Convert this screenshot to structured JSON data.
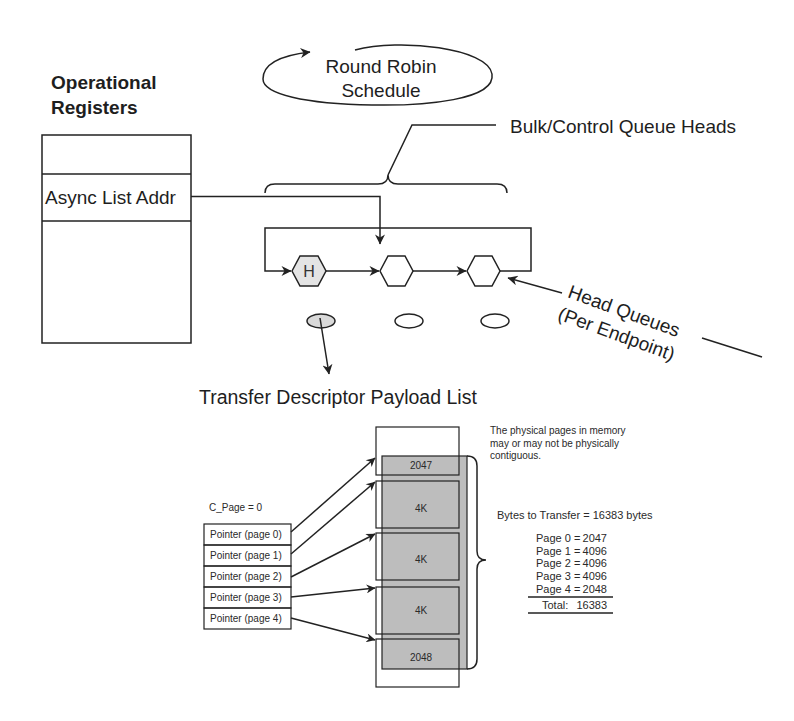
{
  "title_block": {
    "line1": "Operational",
    "line2": "Registers"
  },
  "registers": {
    "rows": [
      "",
      "Async List Addr",
      ""
    ]
  },
  "round_robin": {
    "line1": "Round Robin",
    "line2": "Schedule"
  },
  "bulk_label": "Bulk/Control Queue Heads",
  "queue_heads": [
    {
      "label": "H"
    },
    {
      "label": ""
    },
    {
      "label": ""
    }
  ],
  "head_queues_label": {
    "line1": "Head Queues",
    "line2": "(Per Endpoint)"
  },
  "payload_title": "Transfer Descriptor Payload List",
  "note": {
    "lines": [
      "The physical pages in memory",
      "may or may not be physically",
      "contiguous."
    ]
  },
  "c_page": "C_Page = 0",
  "pointers": [
    "Pointer (page 0)",
    "Pointer (page 1)",
    "Pointer (page 2)",
    "Pointer (page 3)",
    "Pointer (page 4)"
  ],
  "pages": [
    "2047",
    "4K",
    "4K",
    "4K",
    "2048"
  ],
  "bytes_summary": {
    "header": "Bytes to Transfer = 16383 bytes",
    "rows": [
      {
        "label": "Page 0 =",
        "value": "2047"
      },
      {
        "label": "Page 1 =",
        "value": "4096"
      },
      {
        "label": "Page 2 =",
        "value": "4096"
      },
      {
        "label": "Page 3 =",
        "value": "4096"
      },
      {
        "label": "Page 4 =",
        "value": "2048"
      }
    ],
    "total_label": "Total:",
    "total_value": "16383"
  },
  "colors": {
    "line": "#222222",
    "page_fill": "#bdbdbd",
    "head_hex_fill": "#e4e4e4",
    "active_ellipse_fill": "#d9d9d9",
    "background": "#ffffff"
  }
}
